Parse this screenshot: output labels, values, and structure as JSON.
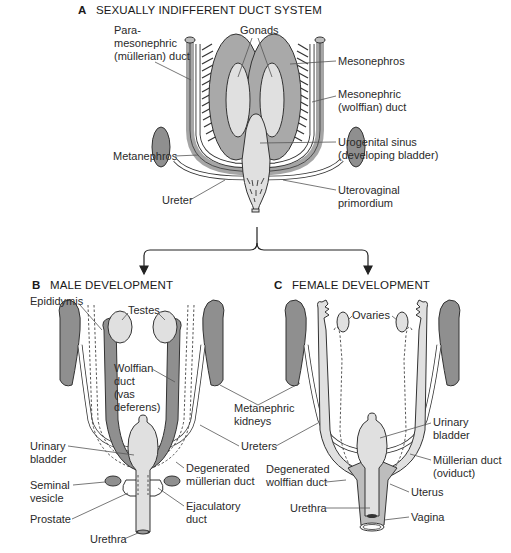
{
  "panels": [
    {
      "letter": "A",
      "title": "SEXUALLY INDIFFERENT DUCT SYSTEM",
      "labels": {
        "paramesonephric": [
          "Para-",
          "mesonephric",
          "(müllerian) duct"
        ],
        "gonads": "Gonads",
        "mesonephros": "Mesonephros",
        "mesonephric_duct": [
          "Mesonephric",
          "(wolffian) duct"
        ],
        "metanephros": "Metanephros",
        "urogenital_sinus": [
          "Urogenital sinus",
          "(developing bladder)"
        ],
        "ureter": "Ureter",
        "uterovaginal": [
          "Uterovaginal",
          "primordium"
        ]
      }
    },
    {
      "letter": "B",
      "title": "MALE DEVELOPMENT",
      "labels": {
        "epididymis": "Epididymis",
        "testes": "Testes",
        "wolffian_duct": [
          "Wolffian",
          "duct",
          "(vas",
          "deferens)"
        ],
        "urinary_bladder": [
          "Urinary",
          "bladder"
        ],
        "seminal_vesicle": [
          "Seminal",
          "vesicle"
        ],
        "prostate": "Prostate",
        "degenerated_mullerian": [
          "Degenerated",
          "müllerian duct"
        ],
        "ejaculatory_duct": [
          "Ejaculatory",
          "duct"
        ],
        "urethra": "Urethra"
      }
    },
    {
      "letter": "C",
      "title": "FEMALE DEVELOPMENT",
      "labels": {
        "ovaries": "Ovaries",
        "urinary_bladder": [
          "Urinary",
          "bladder"
        ],
        "mullerian_duct": [
          "Müllerian duct",
          "(oviduct)"
        ],
        "degenerated_wolffian": [
          "Degenerated",
          "wolffian duct"
        ],
        "uterus": "Uterus",
        "urethra": "Urethra",
        "vagina": "Vagina"
      }
    }
  ],
  "shared_labels": {
    "metanephric_kidneys": [
      "Metanephric",
      "kidneys"
    ],
    "ureters": "Ureters"
  },
  "colors": {
    "dark_tissue": "#8f8f8f",
    "mid_tissue": "#bdbdbd",
    "light_tissue": "#e0e0e0",
    "line": "#333333"
  }
}
